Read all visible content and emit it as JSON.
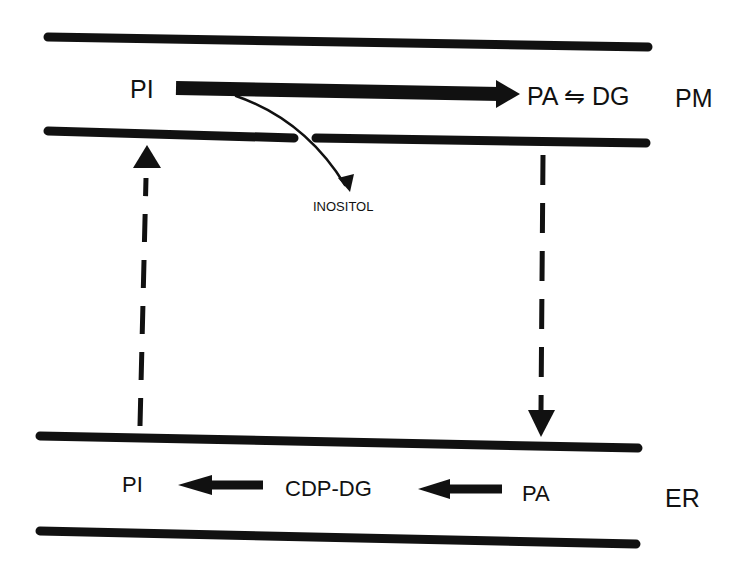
{
  "diagram": {
    "compartments": {
      "pm": {
        "label": "PM",
        "name": "plasma membrane"
      },
      "er": {
        "label": "ER",
        "name": "endoplasmic reticulum"
      }
    },
    "pm_labels": {
      "pi": "PI",
      "pa_dg": "PA ⇋ DG",
      "inositol": "INOSITOL"
    },
    "er_labels": {
      "pi": "PI",
      "cdp_dg": "CDP-DG",
      "pa": "PA"
    },
    "edges": [
      {
        "from": "PM.PI",
        "to": "PM.PA ⇋ DG",
        "style": "solid-thick"
      },
      {
        "from": "PM.PI",
        "to": "INOSITOL",
        "style": "solid-thin-curved"
      },
      {
        "from": "PM.PA",
        "to": "ER.PA",
        "style": "dashed"
      },
      {
        "from": "ER.PA",
        "to": "ER.CDP-DG",
        "style": "solid"
      },
      {
        "from": "ER.CDP-DG",
        "to": "ER.PI",
        "style": "solid"
      },
      {
        "from": "ER.PI",
        "to": "PM.PI",
        "style": "dashed"
      }
    ],
    "colors": {
      "ink": "#111111",
      "background": "#ffffff"
    }
  }
}
